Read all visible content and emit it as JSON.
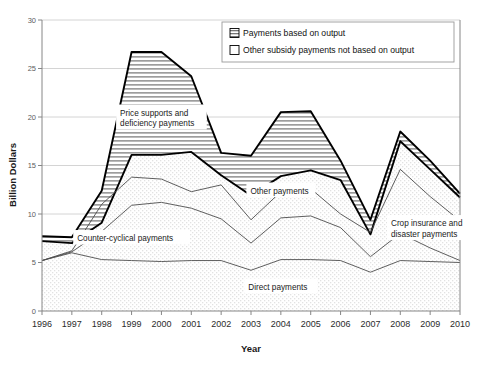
{
  "chart_data": {
    "type": "area",
    "title": "",
    "xlabel": "Year",
    "ylabel": "Billion Dollars",
    "xlim": [
      1996,
      2010
    ],
    "ylim": [
      0,
      30
    ],
    "ytick_step": 5,
    "grid": "horizontal",
    "legend_position": "top-right",
    "categories": [
      1996,
      1997,
      1998,
      1999,
      2000,
      2001,
      2002,
      2003,
      2004,
      2005,
      2006,
      2007,
      2008,
      2009,
      2010
    ],
    "xticklabels": [
      "1996",
      "1997",
      "1998",
      "1999",
      "2000",
      "2001",
      "2002",
      "2003",
      "2004",
      "2005",
      "2006",
      "2007",
      "2008",
      "2009",
      "2010"
    ],
    "yticklabels": [
      "0",
      "5",
      "10",
      "15",
      "20",
      "25",
      "30"
    ],
    "series": [
      {
        "name": "Payments based on output",
        "fill": "hatched",
        "note": "Upper band: total minus other-subsidy boundary",
        "values_total": [
          7.7,
          7.6,
          12.4,
          26.7,
          26.7,
          24.2,
          16.3,
          16.0,
          20.5,
          20.6,
          15.5,
          9.4,
          18.5,
          15.5,
          12.1
        ]
      },
      {
        "name": "Other subsidy payments not based on output",
        "fill": "dotted-light",
        "note": "Lower band boundary (other payments, non-output-based)",
        "values_boundary": [
          7.2,
          7.0,
          9.1,
          16.1,
          16.1,
          16.4,
          14.0,
          11.9,
          13.9,
          14.5,
          13.5,
          7.9,
          17.5,
          14.6,
          11.7
        ]
      }
    ],
    "inner_lines": [
      {
        "name": "Counter-cyclical payments",
        "values": [
          5.2,
          6.2,
          11.0,
          13.8,
          13.6,
          12.3,
          13.0,
          9.4,
          12.3,
          12.6,
          10.0,
          8.1,
          14.6,
          11.8,
          9.3
        ]
      },
      {
        "name": "Other payments",
        "values": [
          5.2,
          6.1,
          8.2,
          10.9,
          11.2,
          10.6,
          9.5,
          7.0,
          9.6,
          9.8,
          8.6,
          5.6,
          8.0,
          6.5,
          5.2
        ]
      },
      {
        "name": "Crop insurance and disaster payments",
        "values": [
          5.2,
          6.0,
          5.3,
          5.2,
          5.1,
          5.2,
          5.2,
          4.2,
          5.3,
          5.3,
          5.2,
          4.0,
          5.2,
          5.1,
          5.0
        ]
      }
    ],
    "annotations": [
      {
        "id": "price-supports",
        "text_line1": "Price supports and",
        "text_line2": "deficiency payments",
        "x": 2000,
        "y": 20.0
      },
      {
        "id": "counter-cyclical",
        "text_line1": "Counter-cyclical payments",
        "text_line2": "",
        "x": 1999,
        "y": 7.6
      },
      {
        "id": "other-payments",
        "text_line1": "Other payments",
        "text_line2": "",
        "x": 2004,
        "y": 12.5
      },
      {
        "id": "crop-insurance",
        "text_line1": "Crop insurance and",
        "text_line2": "disaster payments",
        "x": 2009,
        "y": 8.6
      },
      {
        "id": "direct-payments",
        "text_line1": "Direct payments",
        "text_line2": "",
        "x": 2004,
        "y": 2.6
      }
    ],
    "legend": [
      {
        "label": "Payments based on output",
        "swatch": "hatched"
      },
      {
        "label": "Other subsidy payments not based on output",
        "swatch": "empty"
      }
    ],
    "colors": {
      "outline": "#000000",
      "hatch": "#9a9a9a",
      "grid": "#d4d4d4",
      "axis": "#868686",
      "text": "#1a1a1a"
    }
  },
  "caption": {
    "text": ""
  }
}
